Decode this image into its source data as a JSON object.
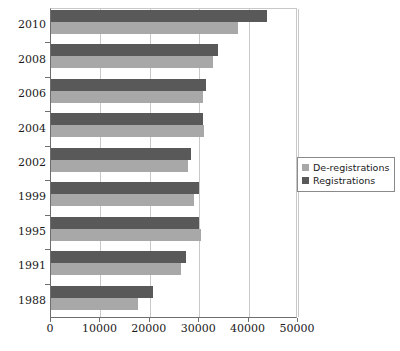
{
  "chart_data": {
    "type": "bar",
    "orientation": "horizontal",
    "title": "",
    "xlabel": "",
    "ylabel": "",
    "xlim": [
      0,
      50000
    ],
    "xticks": [
      0,
      10000,
      20000,
      30000,
      40000,
      50000
    ],
    "xtick_labels": [
      "0",
      "10000",
      "20000",
      "30000",
      "40000",
      "50000"
    ],
    "categories": [
      "1988",
      "1991",
      "1995",
      "1999",
      "2002",
      "2004",
      "2006",
      "2008",
      "2010"
    ],
    "category_labels_shown": [
      "2010",
      "2008",
      "2006",
      "2004",
      "2002",
      "1999",
      "1995",
      "1991",
      "1988"
    ],
    "grid": true,
    "grid_axis": "x",
    "legend_position": "right",
    "series": [
      {
        "name": "De-registrations",
        "color": "#a8a8a8",
        "values": [
          17600,
          26300,
          30300,
          29000,
          27800,
          31000,
          30800,
          32800,
          37900
        ]
      },
      {
        "name": "Registrations",
        "color": "#595959",
        "values": [
          20600,
          27300,
          29900,
          29900,
          28300,
          30700,
          31400,
          33800,
          43700
        ]
      }
    ]
  },
  "legend": {
    "items": [
      {
        "label": "De-registrations",
        "color": "#a8a8a8"
      },
      {
        "label": "Registrations",
        "color": "#595959"
      }
    ]
  },
  "colors": {
    "deregistrations": "#a8a8a8",
    "registrations": "#595959",
    "gridline": "#c9c9c9",
    "axis": "#6e6e6e",
    "text": "#1a1a1a",
    "background": "#ffffff"
  }
}
